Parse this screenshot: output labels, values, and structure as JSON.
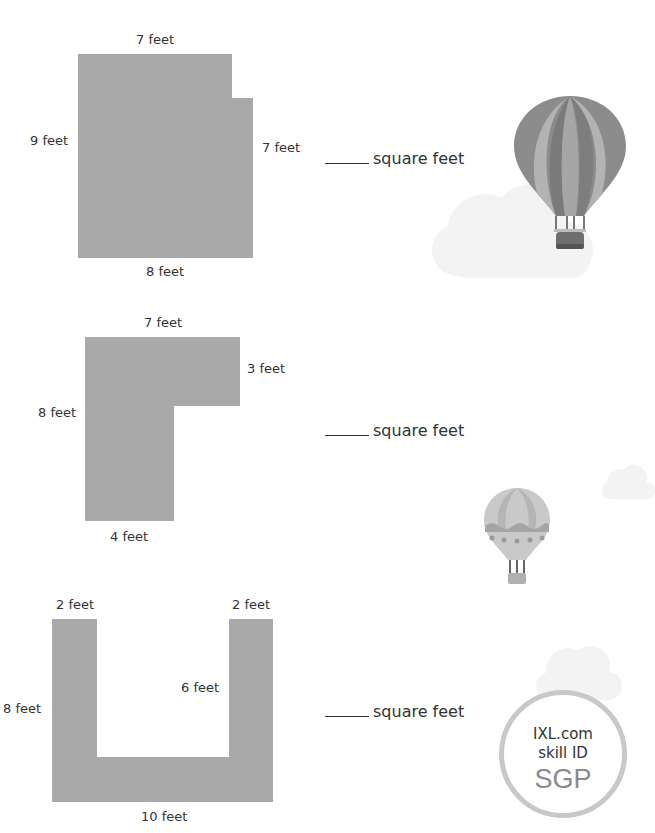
{
  "problems": [
    {
      "shape": "notched-rectangle",
      "labels": {
        "top": "7 feet",
        "left": "9 feet",
        "right": "7 feet",
        "bottom": "8 feet"
      },
      "answer_unit": "square feet"
    },
    {
      "shape": "L-shape",
      "labels": {
        "top": "7 feet",
        "right": "3 feet",
        "left": "8 feet",
        "bottom": "4 feet"
      },
      "answer_unit": "square feet"
    },
    {
      "shape": "U-shape",
      "labels": {
        "top_left": "2 feet",
        "top_right": "2 feet",
        "left": "8 feet",
        "inner": "6 feet",
        "bottom": "10 feet"
      },
      "answer_unit": "square feet"
    }
  ],
  "badge": {
    "line1": "IXL.com",
    "line2": "skill ID",
    "code": "SGP"
  },
  "decorations": [
    "hot-air-balloon-striped",
    "cloud",
    "hot-air-balloon-small",
    "cloud-small",
    "cloud-badge"
  ],
  "colors": {
    "shape_fill": "#a9a9a9",
    "text": "#333333",
    "badge_ring": "#c8c8c8",
    "badge_code": "#8a8a8a"
  }
}
